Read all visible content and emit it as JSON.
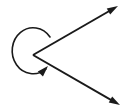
{
  "figure": {
    "background_color": "#ffffff",
    "stroke_color": "#1a1a1a",
    "canvas": {
      "width": 125,
      "height": 110
    },
    "vertex": {
      "label": "vertex",
      "x": 33,
      "y": 55
    },
    "rays": [
      {
        "name": "upper-ray",
        "from": {
          "x": 33,
          "y": 55
        },
        "to": {
          "x": 118,
          "y": 6
        },
        "arrowhead": "end",
        "stroke_width": 2
      },
      {
        "name": "lower-ray",
        "from": {
          "x": 33,
          "y": 55
        },
        "to": {
          "x": 120,
          "y": 105
        },
        "arrowhead": "end",
        "stroke_width": 2
      }
    ],
    "arc": {
      "name": "reflex-angle-arc",
      "start": {
        "x": 50,
        "y": 37
      },
      "end": {
        "x": 46,
        "y": 69
      },
      "radius_x": 21,
      "radius_y": 23,
      "sweep": "counterclockwise",
      "large_arc": true,
      "arrowhead": "end",
      "stroke_width": 1.6,
      "leftmost_x": 13,
      "top_y": 30,
      "bottom_y": 78
    },
    "arrowheads": [
      {
        "name": "upper-ray-arrowhead",
        "tip_x": 118,
        "tip_y": 6,
        "angle_deg": -30
      },
      {
        "name": "lower-ray-arrowhead",
        "tip_x": 120,
        "tip_y": 105,
        "angle_deg": 30
      },
      {
        "name": "arc-arrowhead",
        "tip_x": 48,
        "tip_y": 66,
        "angle_deg": -46
      }
    ]
  }
}
